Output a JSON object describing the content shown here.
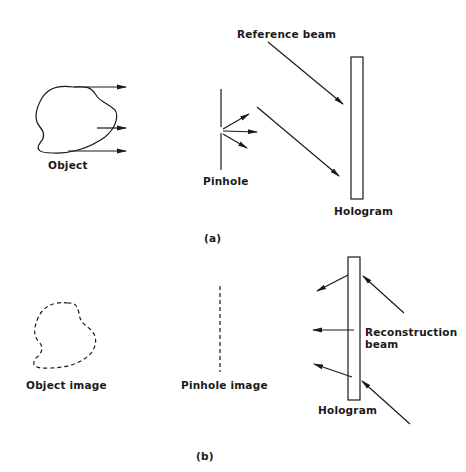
{
  "figure": {
    "panel_a": {
      "caption": "(a)",
      "labels": {
        "object": "Object",
        "pinhole": "Pinhole",
        "reference_beam": "Reference beam",
        "hologram": "Hologram"
      }
    },
    "panel_b": {
      "caption": "(b)",
      "labels": {
        "object_image": "Object image",
        "pinhole_image": "Pinhole image",
        "reconstruction_beam_line1": "Reconstruction",
        "reconstruction_beam_line2": "beam",
        "hologram": "Hologram"
      }
    },
    "colors": {
      "ink": "#1a1a1a",
      "background": "#ffffff"
    }
  }
}
